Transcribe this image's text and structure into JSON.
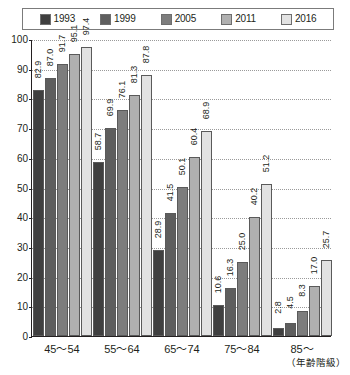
{
  "chart_data": {
    "type": "bar",
    "title": "",
    "subtitle": "",
    "xlabel": "（年齢階級）",
    "ylabel": "",
    "ylim": [
      0,
      100
    ],
    "ytick_step": 10,
    "grid": true,
    "legend_position": "top",
    "yticks": [
      "0",
      "10",
      "20",
      "30",
      "40",
      "50",
      "60",
      "70",
      "80",
      "90",
      "100"
    ],
    "categories": [
      "45～54",
      "55～64",
      "65～74",
      "75～84",
      "85～"
    ],
    "series": [
      {
        "name": "1993",
        "color": "#3f3f3f",
        "values": [
          82.9,
          58.7,
          28.9,
          10.6,
          2.8
        ],
        "labels": [
          "82.9",
          "58.7",
          "28.9",
          "10.6",
          "2.8"
        ]
      },
      {
        "name": "1999",
        "color": "#5e5e5e",
        "values": [
          87.0,
          69.9,
          41.5,
          16.3,
          4.5
        ],
        "labels": [
          "87.0",
          "69.9",
          "41.5",
          "16.3",
          "4.5"
        ]
      },
      {
        "name": "2005",
        "color": "#7d7d7d",
        "values": [
          91.7,
          76.1,
          50.1,
          25.0,
          8.3
        ],
        "labels": [
          "91.7",
          "76.1",
          "50.1",
          "25.0",
          "8.3"
        ]
      },
      {
        "name": "2011",
        "color": "#b0b0b0",
        "values": [
          95.1,
          81.3,
          60.4,
          40.2,
          17.0
        ],
        "labels": [
          "95.1",
          "81.3",
          "60.4",
          "40.2",
          "17.0"
        ]
      },
      {
        "name": "2016",
        "color": "#e2e2e2",
        "values": [
          97.4,
          87.8,
          68.9,
          51.2,
          25.7
        ],
        "labels": [
          "97.4",
          "87.8",
          "68.9",
          "51.2",
          "25.7"
        ]
      }
    ]
  }
}
